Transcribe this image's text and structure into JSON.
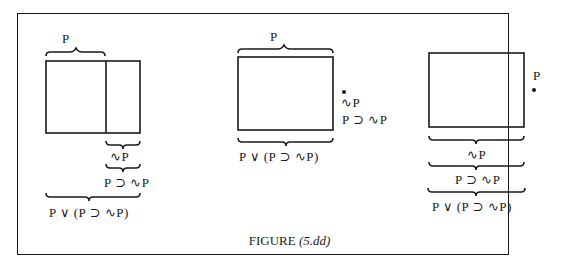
{
  "figure": {
    "caption_label": "FIGURE",
    "caption_number": "(5.dd)"
  },
  "panels": [
    {
      "id": "left",
      "labels": {
        "top_brace": "P",
        "brace_1": "∿P",
        "brace_2": "P ⊃ ∿P",
        "brace_3": "P ∨ (P ⊃ ∿P)"
      }
    },
    {
      "id": "middle",
      "labels": {
        "top_brace": "P",
        "side_1": "∿P",
        "side_2": "P ⊃ ∿P",
        "bottom_brace": "P ∨ (P ⊃ ∿P)"
      }
    },
    {
      "id": "right",
      "labels": {
        "side_point": "P",
        "brace_1": "∿P",
        "brace_2": "P ⊃ ∿P",
        "brace_3": "P ∨ (P ⊃ ∿P)"
      }
    }
  ],
  "colors": {
    "ink": "#1a1a1a",
    "paper": "#ffffff"
  }
}
